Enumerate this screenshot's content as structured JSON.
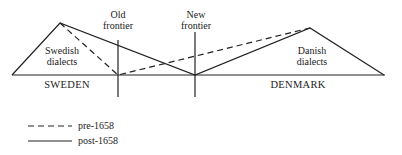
{
  "labels": {
    "old_frontier": [
      "Old",
      "frontier"
    ],
    "new_frontier": [
      "New",
      "frontier"
    ],
    "swedish": [
      "Swedish",
      "dialects"
    ],
    "danish": [
      "Danish",
      "dialects"
    ],
    "sweden": "SWEDEN",
    "denmark": "DENMARK"
  },
  "legend": [
    {
      "style": "dashed",
      "label": "pre-1658"
    },
    {
      "style": "solid",
      "label": "post-1658"
    }
  ],
  "colors": {
    "line": "#222222"
  }
}
